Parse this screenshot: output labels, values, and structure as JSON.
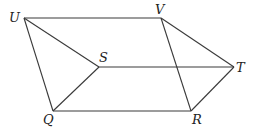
{
  "diagram": {
    "type": "geometric-figure",
    "stroke_color": "#3a3a3a",
    "vertices": {
      "U": {
        "label": "U",
        "x": 24,
        "y": 18,
        "lx": 9,
        "ly": 22
      },
      "V": {
        "label": "V",
        "x": 161,
        "y": 18,
        "lx": 155,
        "ly": 14
      },
      "S": {
        "label": "S",
        "x": 99,
        "y": 67,
        "lx": 99,
        "ly": 62
      },
      "T": {
        "label": "T",
        "x": 234,
        "y": 67,
        "lx": 236,
        "ly": 72
      },
      "Q": {
        "label": "Q",
        "x": 53,
        "y": 111,
        "lx": 43,
        "ly": 124
      },
      "R": {
        "label": "R",
        "x": 191,
        "y": 111,
        "lx": 192,
        "ly": 124
      }
    },
    "edges": [
      [
        "U",
        "V"
      ],
      [
        "U",
        "S"
      ],
      [
        "U",
        "Q"
      ],
      [
        "V",
        "T"
      ],
      [
        "V",
        "R"
      ],
      [
        "S",
        "T"
      ],
      [
        "S",
        "Q"
      ],
      [
        "Q",
        "R"
      ],
      [
        "R",
        "T"
      ]
    ]
  }
}
